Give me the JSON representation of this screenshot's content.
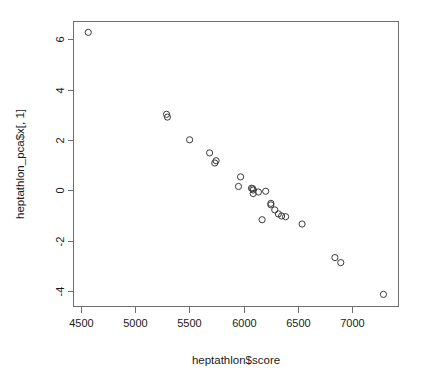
{
  "chart_data": {
    "type": "scatter",
    "title": "",
    "xlabel": "heptathlon$score",
    "ylabel": "heptathlon_pca$x[, 1]",
    "xlim": [
      4430,
      7430
    ],
    "ylim": [
      -4.6,
      6.7
    ],
    "xticks": [
      4500,
      5000,
      5500,
      6000,
      6500,
      7000
    ],
    "xtick_labels": [
      "4500",
      "5000",
      "5500",
      "6000",
      "6500",
      "7000"
    ],
    "yticks": [
      6,
      4,
      2,
      0,
      -2,
      -4
    ],
    "ytick_labels": [
      "6",
      "4",
      "2",
      "0",
      "-2",
      "-4"
    ],
    "grid": false,
    "legend": null,
    "point_symbol": "open-circle",
    "point_color": "#3c3c3c",
    "axis_color": "#6e6e6e",
    "background": "#ffffff",
    "n_points": 25,
    "x": [
      4566,
      5289,
      5297,
      5502,
      5686,
      5746,
      5734,
      5972,
      5953,
      6073,
      6084,
      6090,
      6089,
      6137,
      6171,
      6204,
      6252,
      6252,
      6288,
      6321,
      6351,
      6388,
      6540,
      6843,
      6897,
      7291
    ],
    "y": [
      6.27,
      3.02,
      2.91,
      2.01,
      1.49,
      1.18,
      1.09,
      0.54,
      0.16,
      0.09,
      0.07,
      0.02,
      -0.12,
      -0.06,
      -1.16,
      -0.03,
      -0.57,
      -0.51,
      -0.77,
      -0.93,
      -1.01,
      -1.04,
      -1.33,
      -2.66,
      -2.86,
      -4.12
    ],
    "points": [
      {
        "x": 4566,
        "y": 6.27
      },
      {
        "x": 5289,
        "y": 3.02
      },
      {
        "x": 5297,
        "y": 2.91
      },
      {
        "x": 5502,
        "y": 2.01
      },
      {
        "x": 5686,
        "y": 1.49
      },
      {
        "x": 5746,
        "y": 1.18
      },
      {
        "x": 5734,
        "y": 1.09
      },
      {
        "x": 5972,
        "y": 0.54
      },
      {
        "x": 5953,
        "y": 0.16
      },
      {
        "x": 6073,
        "y": 0.09
      },
      {
        "x": 6084,
        "y": 0.07
      },
      {
        "x": 6090,
        "y": 0.02
      },
      {
        "x": 6089,
        "y": -0.12
      },
      {
        "x": 6137,
        "y": -0.06
      },
      {
        "x": 6171,
        "y": -1.16
      },
      {
        "x": 6204,
        "y": -0.03
      },
      {
        "x": 6252,
        "y": -0.57
      },
      {
        "x": 6252,
        "y": -0.51
      },
      {
        "x": 6288,
        "y": -0.77
      },
      {
        "x": 6321,
        "y": -0.93
      },
      {
        "x": 6351,
        "y": -1.01
      },
      {
        "x": 6388,
        "y": -1.04
      },
      {
        "x": 6540,
        "y": -1.33
      },
      {
        "x": 6843,
        "y": -2.66
      },
      {
        "x": 6897,
        "y": -2.86
      },
      {
        "x": 7291,
        "y": -4.12
      }
    ]
  }
}
